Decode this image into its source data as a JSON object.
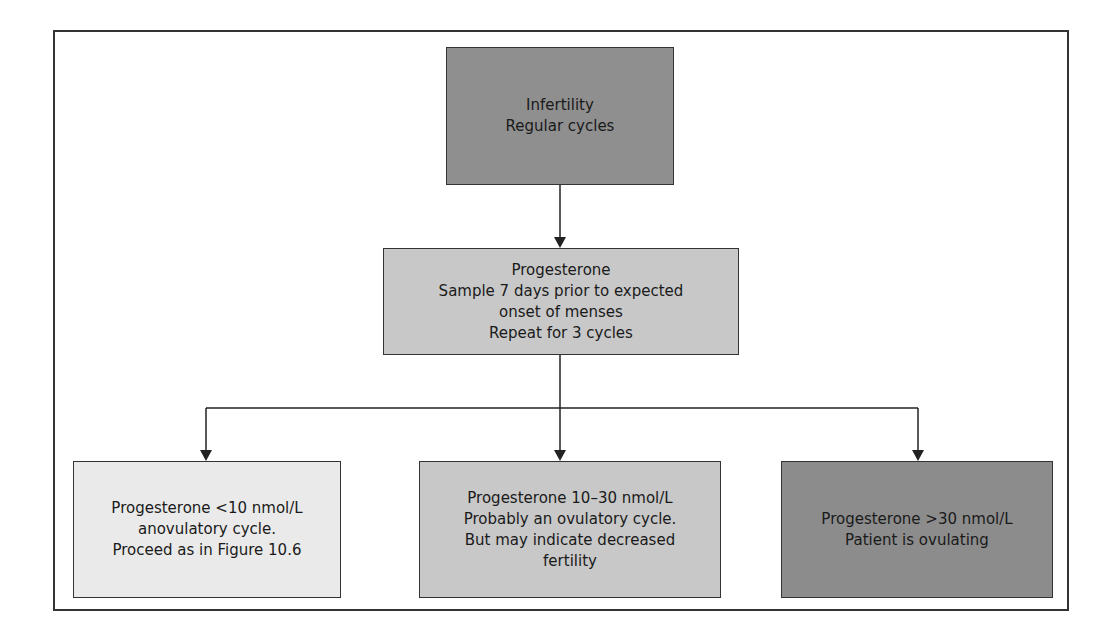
{
  "diagram": {
    "type": "flowchart",
    "nodes": {
      "start": {
        "text": "Infertility\nRegular cycles",
        "fill": "#8f8f8f"
      },
      "test": {
        "text": "Progesterone\nSample 7 days prior to expected\nonset of menses\nRepeat for 3 cycles",
        "fill": "#c8c8c8"
      },
      "low": {
        "text": "Progesterone <10 nmol/L\nanovulatory cycle.\nProceed as in Figure 10.6",
        "fill": "#eaeaea"
      },
      "mid": {
        "text": "Progesterone 10–30 nmol/L\nProbably an ovulatory cycle.\nBut may indicate decreased\nfertility",
        "fill": "#c8c8c8"
      },
      "high": {
        "text": "Progesterone >30 nmol/L\nPatient is ovulating",
        "fill": "#8c8c8c"
      }
    },
    "edges": [
      {
        "from": "start",
        "to": "test"
      },
      {
        "from": "test",
        "to": "low"
      },
      {
        "from": "test",
        "to": "mid"
      },
      {
        "from": "test",
        "to": "high"
      }
    ],
    "line_color": "#222222"
  }
}
